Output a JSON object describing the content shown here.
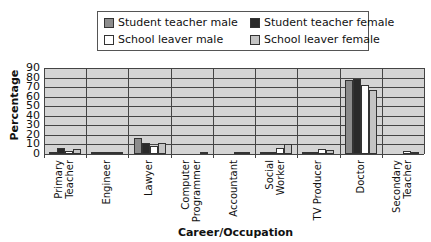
{
  "chart_data": {
    "type": "bar",
    "title": "",
    "xlabel": "Career/Occupation",
    "ylabel": "Percentage",
    "ylim": [
      0,
      90
    ],
    "yticks": [
      0,
      10,
      20,
      30,
      40,
      50,
      60,
      70,
      80,
      90
    ],
    "grid": true,
    "legend_position": "top",
    "categories": [
      "Primary Teacher",
      "Engineer",
      "Lawyer",
      "Computer Programmer",
      "Accountant",
      "Social Worker",
      "TV Producer",
      "Doctor",
      "Secondary Teacher"
    ],
    "series": [
      {
        "name": "Student teacher male",
        "color": "#8c8c8c",
        "values": [
          2,
          2,
          17,
          0,
          0,
          1,
          2,
          77,
          0
        ]
      },
      {
        "name": "Student teacher female",
        "color": "#2a2a2a",
        "values": [
          6,
          1,
          12,
          0,
          0,
          1,
          1,
          78,
          0
        ]
      },
      {
        "name": "School leaver male",
        "color": "#ffffff",
        "values": [
          3,
          1,
          8,
          0,
          2,
          6,
          5,
          72,
          3
        ]
      },
      {
        "name": "School leaver female",
        "color": "#c4c4c4",
        "values": [
          5,
          1,
          12,
          1,
          1,
          10,
          4,
          67,
          2
        ]
      }
    ]
  },
  "legend": {
    "items": [
      {
        "label": "Student teacher male",
        "color": "#8c8c8c"
      },
      {
        "label": "Student teacher female",
        "color": "#2a2a2a"
      },
      {
        "label": "School leaver male",
        "color": "#ffffff"
      },
      {
        "label": "School leaver female",
        "color": "#c4c4c4"
      }
    ]
  },
  "axes": {
    "ylabel": "Percentage",
    "xlabel": "Career/Occupation",
    "yticks": [
      "90",
      "80",
      "70",
      "60",
      "50",
      "40",
      "30",
      "20",
      "10",
      "0"
    ],
    "xlabels": [
      "Primary\nTeacher",
      "Engineer",
      "Lawyer",
      "Computer\nProgrammer",
      "Accountant",
      "Social\nWorker",
      "TV Producer",
      "Doctor",
      "Secondary\nTeacher"
    ]
  }
}
